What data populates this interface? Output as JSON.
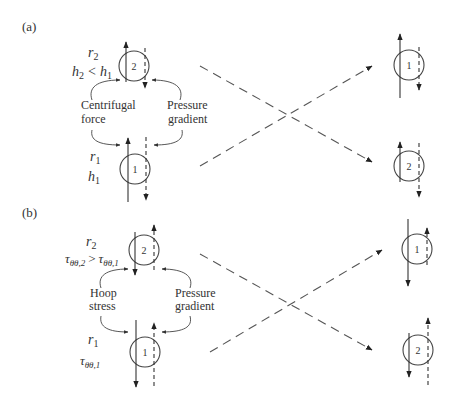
{
  "panels": {
    "a": {
      "tag": "(a)",
      "upper": {
        "label_r": "r",
        "label_r_sub": "2",
        "relation": {
          "h2": "h",
          "h2_sub": "2",
          "op": "<",
          "h1": "h",
          "h1_sub": "1"
        },
        "eddy": "2"
      },
      "lower": {
        "label_r": "r",
        "label_r_sub": "1",
        "label_h": "h",
        "label_h_sub": "1",
        "eddy": "1"
      },
      "left_force": {
        "line1": "Centrifugal",
        "line2": "force"
      },
      "right_force": {
        "line1": "Pressure",
        "line2": "gradient"
      },
      "right_top_eddy": "1",
      "right_bottom_eddy": "2"
    },
    "b": {
      "tag": "(b)",
      "upper": {
        "label_r": "r",
        "label_r_sub": "2",
        "relation": {
          "lhs": "τ",
          "lhs_sub": "θθ,2",
          "op": ">",
          "rhs": "τ",
          "rhs_sub": "θθ,1"
        },
        "eddy": "2"
      },
      "lower": {
        "label_r": "r",
        "label_r_sub": "1",
        "label_t": "τ",
        "label_t_sub": "θθ,1",
        "eddy": "1"
      },
      "left_force": {
        "line1": "Hoop",
        "line2": "stress"
      },
      "right_force": {
        "line1": "Pressure",
        "line2": "gradient"
      },
      "right_top_eddy": "1",
      "right_bottom_eddy": "2"
    }
  }
}
